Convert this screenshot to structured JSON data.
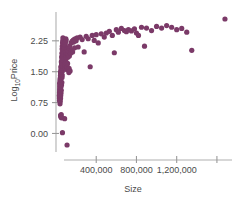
{
  "chart_data": {
    "type": "scatter",
    "title": "",
    "xlabel": "Size",
    "ylabel": "Log10Price",
    "ylabel_base": "Log",
    "ylabel_sub": "10",
    "ylabel_rest": "Price",
    "xlim": [
      0,
      1750000
    ],
    "ylim": [
      -0.45,
      2.95
    ],
    "grid": false,
    "legend": null,
    "marker_color": "#7B3A68",
    "marker_size": 2.6,
    "xticks": [
      400000,
      800000,
      1200000,
      1600000
    ],
    "xtick_labels": [
      "400,000",
      "800,000",
      "1,200,000",
      ""
    ],
    "yticks": [
      0.0,
      0.75,
      1.5,
      2.25
    ],
    "ytick_labels": [
      "0.00",
      "0.75",
      "1.50",
      "2.25"
    ],
    "points": [
      [
        40000,
        0.72
      ],
      [
        42000,
        0.78
      ],
      [
        45000,
        0.85
      ],
      [
        47000,
        0.92
      ],
      [
        50000,
        0.98
      ],
      [
        52000,
        1.05
      ],
      [
        48000,
        1.12
      ],
      [
        55000,
        1.18
      ],
      [
        58000,
        1.24
      ],
      [
        43000,
        1.3
      ],
      [
        60000,
        1.36
      ],
      [
        62000,
        1.42
      ],
      [
        46000,
        1.48
      ],
      [
        64000,
        1.52
      ],
      [
        66000,
        1.58
      ],
      [
        49000,
        1.62
      ],
      [
        68000,
        1.66
      ],
      [
        70000,
        1.7
      ],
      [
        53000,
        1.74
      ],
      [
        72000,
        1.78
      ],
      [
        74000,
        1.82
      ],
      [
        56000,
        1.86
      ],
      [
        76000,
        1.88
      ],
      [
        78000,
        1.92
      ],
      [
        59000,
        1.95
      ],
      [
        80000,
        1.98
      ],
      [
        82000,
        2.02
      ],
      [
        61000,
        2.05
      ],
      [
        84000,
        2.08
      ],
      [
        86000,
        2.1
      ],
      [
        63000,
        2.12
      ],
      [
        88000,
        2.15
      ],
      [
        90000,
        2.18
      ],
      [
        65000,
        2.2
      ],
      [
        92000,
        2.22
      ],
      [
        67000,
        2.25
      ],
      [
        95000,
        2.28
      ],
      [
        98000,
        2.3
      ],
      [
        69000,
        2.32
      ],
      [
        100000,
        2.26
      ],
      [
        44000,
        0.88
      ],
      [
        41000,
        0.95
      ],
      [
        39000,
        1.02
      ],
      [
        38000,
        1.08
      ],
      [
        37000,
        1.15
      ],
      [
        36000,
        1.22
      ],
      [
        40000,
        1.28
      ],
      [
        42000,
        1.34
      ],
      [
        44000,
        1.4
      ],
      [
        46000,
        1.45
      ],
      [
        48000,
        1.5
      ],
      [
        50000,
        1.55
      ],
      [
        52000,
        1.6
      ],
      [
        54000,
        1.64
      ],
      [
        56000,
        1.68
      ],
      [
        58000,
        1.72
      ],
      [
        60000,
        1.76
      ],
      [
        62000,
        1.8
      ],
      [
        64000,
        1.84
      ],
      [
        66000,
        1.88
      ],
      [
        68000,
        1.9
      ],
      [
        70000,
        1.94
      ],
      [
        72000,
        1.96
      ],
      [
        74000,
        2.0
      ],
      [
        76000,
        2.04
      ],
      [
        78000,
        2.06
      ],
      [
        80000,
        2.09
      ],
      [
        82000,
        2.13
      ],
      [
        84000,
        2.16
      ],
      [
        86000,
        2.19
      ],
      [
        35000,
        0.8
      ],
      [
        34000,
        0.86
      ],
      [
        33000,
        0.92
      ],
      [
        35000,
        0.99
      ],
      [
        37000,
        1.06
      ],
      [
        39000,
        1.12
      ],
      [
        41000,
        1.18
      ],
      [
        43000,
        1.24
      ],
      [
        45000,
        1.31
      ],
      [
        47000,
        1.37
      ],
      [
        49000,
        1.43
      ],
      [
        51000,
        1.49
      ],
      [
        53000,
        1.54
      ],
      [
        55000,
        1.59
      ],
      [
        57000,
        1.65
      ],
      [
        59000,
        1.7
      ],
      [
        61000,
        1.75
      ],
      [
        63000,
        1.79
      ],
      [
        65000,
        1.83
      ],
      [
        67000,
        1.87
      ],
      [
        69000,
        1.91
      ],
      [
        71000,
        1.94
      ],
      [
        73000,
        1.98
      ],
      [
        75000,
        2.01
      ],
      [
        77000,
        2.05
      ],
      [
        79000,
        2.08
      ],
      [
        81000,
        2.11
      ],
      [
        83000,
        2.14
      ],
      [
        85000,
        2.17
      ],
      [
        87000,
        2.21
      ],
      [
        90000,
        1.6
      ],
      [
        92000,
        1.66
      ],
      [
        94000,
        1.72
      ],
      [
        96000,
        1.78
      ],
      [
        98000,
        1.84
      ],
      [
        100000,
        1.9
      ],
      [
        103000,
        1.95
      ],
      [
        105000,
        2.0
      ],
      [
        108000,
        2.05
      ],
      [
        110000,
        1.55
      ],
      [
        112000,
        1.62
      ],
      [
        115000,
        1.7
      ],
      [
        118000,
        1.85
      ],
      [
        120000,
        1.92
      ],
      [
        122000,
        2.0
      ],
      [
        125000,
        2.08
      ],
      [
        128000,
        1.48
      ],
      [
        130000,
        1.58
      ],
      [
        133000,
        1.88
      ],
      [
        136000,
        2.12
      ],
      [
        140000,
        1.52
      ],
      [
        145000,
        1.95
      ],
      [
        150000,
        2.2
      ],
      [
        155000,
        2.02
      ],
      [
        160000,
        2.24
      ],
      [
        165000,
        1.98
      ],
      [
        170000,
        2.26
      ],
      [
        175000,
        2.22
      ],
      [
        180000,
        2.28
      ],
      [
        185000,
        2.08
      ],
      [
        190000,
        2.3
      ],
      [
        200000,
        2.25
      ],
      [
        210000,
        2.32
      ],
      [
        220000,
        2.1
      ],
      [
        240000,
        2.34
      ],
      [
        260000,
        2.28
      ],
      [
        280000,
        1.98
      ],
      [
        300000,
        2.36
      ],
      [
        320000,
        2.3
      ],
      [
        340000,
        1.62
      ],
      [
        360000,
        2.38
      ],
      [
        380000,
        2.26
      ],
      [
        400000,
        2.4
      ],
      [
        420000,
        2.2
      ],
      [
        450000,
        2.42
      ],
      [
        480000,
        2.34
      ],
      [
        500000,
        2.44
      ],
      [
        530000,
        2.48
      ],
      [
        560000,
        2.38
      ],
      [
        580000,
        1.96
      ],
      [
        600000,
        2.52
      ],
      [
        620000,
        2.46
      ],
      [
        650000,
        2.55
      ],
      [
        680000,
        2.5
      ],
      [
        700000,
        2.47
      ],
      [
        720000,
        2.52
      ],
      [
        750000,
        2.49
      ],
      [
        780000,
        2.54
      ],
      [
        800000,
        2.44
      ],
      [
        820000,
        2.38
      ],
      [
        850000,
        2.58
      ],
      [
        880000,
        2.12
      ],
      [
        900000,
        2.56
      ],
      [
        950000,
        2.5
      ],
      [
        1000000,
        2.6
      ],
      [
        1050000,
        2.56
      ],
      [
        1100000,
        2.62
      ],
      [
        1150000,
        2.58
      ],
      [
        1200000,
        2.52
      ],
      [
        1250000,
        2.55
      ],
      [
        1300000,
        2.46
      ],
      [
        1350000,
        2.02
      ],
      [
        1680000,
        2.78
      ],
      [
        46000,
        0.44
      ],
      [
        48000,
        0.42
      ],
      [
        50000,
        0.4
      ],
      [
        52000,
        0.46
      ],
      [
        54000,
        0.38
      ],
      [
        86000,
        0.36
      ],
      [
        64000,
        0.02
      ],
      [
        110000,
        -0.28
      ]
    ]
  }
}
